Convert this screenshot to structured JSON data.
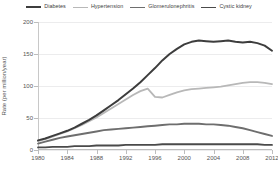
{
  "chart_data": {
    "type": "line",
    "title": "",
    "xlabel": "",
    "ylabel": "Rate (per million/year)",
    "xlim": [
      1980,
      2012
    ],
    "ylim": [
      0,
      200
    ],
    "xticks": [
      1980,
      1984,
      1988,
      1992,
      1996,
      2000,
      2004,
      2008,
      2012
    ],
    "yticks": [
      0,
      50,
      100,
      150,
      200
    ],
    "grid": true,
    "legend_position": "top",
    "x": [
      1980,
      1981,
      1982,
      1983,
      1984,
      1985,
      1986,
      1987,
      1988,
      1989,
      1990,
      1991,
      1992,
      1993,
      1994,
      1995,
      1996,
      1997,
      1998,
      1999,
      2000,
      2001,
      2002,
      2003,
      2004,
      2005,
      2006,
      2007,
      2008,
      2009,
      2010,
      2011,
      2012
    ],
    "series": [
      {
        "name": "Diabetes",
        "color": "#3d3d3d",
        "width": 2.0,
        "values": [
          15,
          18,
          22,
          26,
          30,
          35,
          41,
          47,
          54,
          62,
          70,
          78,
          87,
          96,
          106,
          117,
          128,
          140,
          150,
          158,
          165,
          169,
          171,
          170,
          169,
          170,
          171,
          169,
          168,
          169,
          167,
          163,
          155
        ]
      },
      {
        "name": "Hypertension",
        "color": "#b8b8b8",
        "width": 1.8,
        "values": [
          14,
          17,
          21,
          25,
          29,
          34,
          39,
          45,
          51,
          58,
          65,
          72,
          79,
          86,
          92,
          96,
          83,
          82,
          86,
          90,
          93,
          95,
          96,
          97,
          98,
          99,
          101,
          103,
          105,
          106,
          106,
          105,
          103
        ]
      },
      {
        "name": "Glomerulonephritis",
        "color": "#6e6e6e",
        "width": 1.9,
        "values": [
          10,
          13,
          16,
          19,
          21,
          23,
          25,
          27,
          29,
          31,
          32,
          33,
          34,
          35,
          36,
          37,
          38,
          39,
          40,
          40,
          41,
          41,
          41,
          40,
          40,
          39,
          38,
          36,
          34,
          31,
          28,
          25,
          22
        ]
      },
      {
        "name": "Cystic kidney",
        "color": "#4a4a4a",
        "width": 1.8,
        "values": [
          4,
          4,
          5,
          5,
          5,
          6,
          6,
          6,
          7,
          7,
          7,
          7,
          8,
          8,
          8,
          8,
          8,
          9,
          9,
          9,
          9,
          9,
          9,
          9,
          9,
          9,
          9,
          9,
          9,
          9,
          9,
          8,
          8
        ]
      }
    ]
  },
  "axes": {
    "y_title": "Rate (per million/year)",
    "y_tick_labels": [
      "0",
      "50",
      "100",
      "150",
      "200"
    ],
    "x_tick_labels": [
      "1980",
      "1984",
      "1988",
      "1992",
      "1996",
      "2000",
      "2004",
      "2008",
      "2012"
    ]
  },
  "legend": {
    "items": [
      {
        "label": "Diabetes",
        "color": "#3d3d3d",
        "width": 2.0
      },
      {
        "label": "Hypertension",
        "color": "#b8b8b8",
        "width": 1.6
      },
      {
        "label": "Glomerulonephritis",
        "color": "#6e6e6e",
        "width": 1.8
      },
      {
        "label": "Cystic kidney",
        "color": "#4a4a4a",
        "width": 1.8
      }
    ]
  }
}
